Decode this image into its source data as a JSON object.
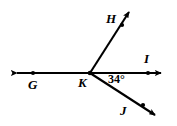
{
  "figure": {
    "type": "geometry-diagram",
    "background_color": "#ffffff",
    "stroke_color": "#000000",
    "width": 177,
    "height": 126,
    "vertex": {
      "name": "K",
      "x": 90,
      "y": 73
    },
    "labels": {
      "G": "G",
      "H": "H",
      "I": "I",
      "J": "J",
      "K": "K",
      "angle": "34°"
    },
    "points": [
      {
        "name": "G",
        "x": 33,
        "y": 73
      },
      {
        "name": "I",
        "x": 148,
        "y": 73
      },
      {
        "name": "H",
        "x": 122,
        "y": 25
      },
      {
        "name": "J",
        "x": 143,
        "y": 105
      },
      {
        "name": "K",
        "x": 90,
        "y": 73
      }
    ],
    "lines": [
      {
        "name": "line-GI",
        "kind": "double-arrow-line",
        "from": {
          "x": 11,
          "y": 73
        },
        "to": {
          "x": 167,
          "y": 73
        },
        "arrow_start": true,
        "arrow_end": true
      },
      {
        "name": "ray-KH",
        "kind": "ray",
        "from": {
          "x": 90,
          "y": 73
        },
        "to": {
          "x": 133,
          "y": 7
        },
        "arrow_start": false,
        "arrow_end": true
      },
      {
        "name": "ray-KJ",
        "kind": "ray",
        "from": {
          "x": 90,
          "y": 73
        },
        "to": {
          "x": 160,
          "y": 118
        },
        "arrow_start": false,
        "arrow_end": true
      }
    ],
    "angles": [
      {
        "name": "angle-IKJ",
        "value": 34,
        "unit": "degrees",
        "label": "34°",
        "rays": [
          "KI",
          "KJ"
        ]
      }
    ]
  }
}
